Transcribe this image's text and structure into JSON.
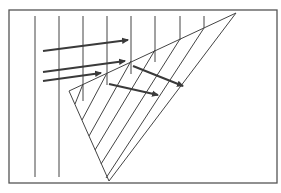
{
  "diagram": {
    "colors": {
      "background": "#ffffff",
      "frame": "#555555",
      "line": "#444444",
      "arrow": "#3a3a3a"
    },
    "frame": {
      "x": 9,
      "y": 10,
      "width": 268,
      "height": 173
    },
    "wavefronts": [
      {
        "x": 35,
        "y1": 16,
        "y2": 177
      },
      {
        "x": 59,
        "y1": 16,
        "y2": 177
      },
      {
        "x": 83,
        "y1": 16,
        "y2": 101
      },
      {
        "x": 107,
        "y1": 16,
        "y2": 85
      },
      {
        "x": 131,
        "y1": 16,
        "y2": 74
      },
      {
        "x": 155,
        "y1": 16,
        "y2": 62
      },
      {
        "x": 180,
        "y1": 16,
        "y2": 40
      },
      {
        "x": 204,
        "y1": 16,
        "y2": 28
      }
    ],
    "triangle": {
      "top_left": [
        69,
        91
      ],
      "top_right": [
        236,
        13
      ],
      "apex": [
        109,
        181
      ]
    },
    "hatch_lines": [
      {
        "x1": 83,
        "y1": 84,
        "x2": 75,
        "y2": 104
      },
      {
        "x1": 107,
        "y1": 73,
        "x2": 82,
        "y2": 120
      },
      {
        "x1": 131,
        "y1": 61,
        "x2": 89,
        "y2": 136
      },
      {
        "x1": 155,
        "y1": 50,
        "x2": 95,
        "y2": 150
      },
      {
        "x1": 180,
        "y1": 39,
        "x2": 101,
        "y2": 164
      },
      {
        "x1": 204,
        "y1": 28,
        "x2": 106,
        "y2": 178
      }
    ],
    "incident_arrows": [
      {
        "x1": 43,
        "y1": 51,
        "x2": 128,
        "y2": 40
      },
      {
        "x1": 43,
        "y1": 72,
        "x2": 125,
        "y2": 61
      },
      {
        "x1": 43,
        "y1": 81,
        "x2": 101,
        "y2": 73
      }
    ],
    "refracted_arrows": [
      {
        "x1": 109,
        "y1": 84,
        "x2": 158,
        "y2": 95
      },
      {
        "x1": 133,
        "y1": 66,
        "x2": 183,
        "y2": 86
      }
    ]
  }
}
